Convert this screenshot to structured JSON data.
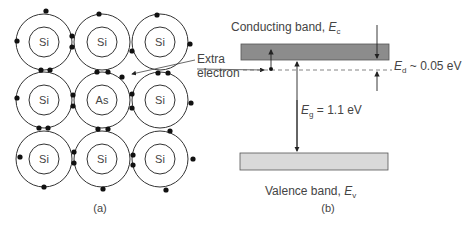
{
  "panel_a": {
    "caption": "(a)",
    "atoms": [
      {
        "label": "Si",
        "row": 0,
        "col": 0
      },
      {
        "label": "Si",
        "row": 0,
        "col": 1
      },
      {
        "label": "Si",
        "row": 0,
        "col": 2
      },
      {
        "label": "Si",
        "row": 1,
        "col": 0
      },
      {
        "label": "As",
        "row": 1,
        "col": 1
      },
      {
        "label": "Si",
        "row": 1,
        "col": 2
      },
      {
        "label": "Si",
        "row": 2,
        "col": 0
      },
      {
        "label": "Si",
        "row": 2,
        "col": 1
      },
      {
        "label": "Si",
        "row": 2,
        "col": 2
      }
    ],
    "annotation": {
      "line1": "Extra",
      "line2": "electron"
    }
  },
  "panel_b": {
    "caption": "(b)",
    "conduction_band": {
      "label": "Conducting band, ",
      "symbol": "E",
      "subscript": "c",
      "color": "#8c8c8c"
    },
    "valence_band": {
      "label": "Valence band, ",
      "symbol": "E",
      "subscript": "v",
      "color": "#d9d9d9"
    },
    "donor_level": {
      "symbol": "E",
      "subscript": "d",
      "value": " ~ 0.05 eV"
    },
    "band_gap": {
      "symbol": "E",
      "subscript": "g",
      "value": " = 1.1 eV"
    }
  }
}
